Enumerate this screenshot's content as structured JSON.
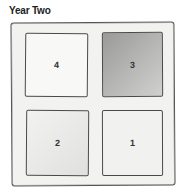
{
  "title": "Year Two",
  "quadrants": [
    {
      "label": "4",
      "position": "top-left",
      "shade": "white"
    },
    {
      "label": "3",
      "position": "top-right",
      "shade": "gray"
    },
    {
      "label": "2",
      "position": "bottom-left",
      "shade": "light-gray"
    },
    {
      "label": "1",
      "position": "bottom-right",
      "shade": "very-light-gray"
    }
  ]
}
